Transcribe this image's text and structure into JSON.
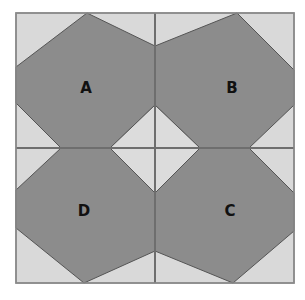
{
  "diagram": {
    "colors": {
      "background": "#ffffff",
      "square_fill": "#d9d9d9",
      "shape_fill": "#8c8c8c",
      "grid_line": "#6e6e6e",
      "shape_stroke": "#555555",
      "label": "#111111"
    },
    "quadrants": [
      {
        "id": "A",
        "label": "A"
      },
      {
        "id": "B",
        "label": "B"
      },
      {
        "id": "C",
        "label": "C"
      },
      {
        "id": "D",
        "label": "D"
      }
    ]
  }
}
